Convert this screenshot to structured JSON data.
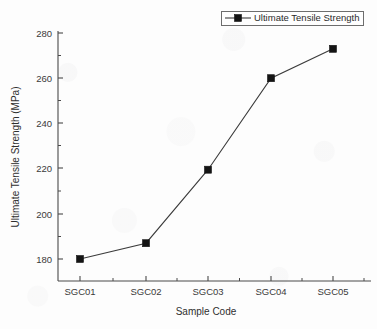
{
  "chart_data": {
    "type": "line",
    "title": "",
    "subtitle": "",
    "xlabel": "Sample Code",
    "ylabel": "Ultimate Tensile Strength (MPa)",
    "categories": [
      "SGC01",
      "SGC02",
      "SGC03",
      "SGC04",
      "SGC05"
    ],
    "series": [
      {
        "name": "Ultimate Tensile Strength",
        "values": [
          180,
          187,
          219.5,
          260,
          273
        ],
        "marker": "filled-square",
        "color": "#141414"
      }
    ],
    "ylim": [
      170,
      282
    ],
    "y_ticks": [
      180,
      200,
      220,
      240,
      260,
      280
    ],
    "y_tick_labels": [
      "180",
      "200",
      "220",
      "240",
      "260",
      "280"
    ],
    "y_minor_ticks": [
      190,
      210,
      230,
      250,
      270
    ],
    "x_tick_labels": [
      "SGC01",
      "SGC02",
      "SGC03",
      "SGC04",
      "SGC05"
    ],
    "grid": false,
    "legend_position": "top-right",
    "legend_entries": [
      "Ultimate Tensile Strength"
    ],
    "units": "MPa"
  },
  "legend": {
    "label": "Ultimate Tensile Strength",
    "marker_shape": "filled-square",
    "marker_color": "#141414",
    "line_color": "#3b3b3b"
  },
  "axes": {
    "x_title": "Sample Code",
    "y_title": "Ultimate Tensile Strength (MPa)",
    "axis_color": "#4a4a4a"
  },
  "colors": {
    "background": "#fdfdfd",
    "series": "#141414",
    "axis": "#4a4a4a",
    "text": "#2f2f2f"
  }
}
